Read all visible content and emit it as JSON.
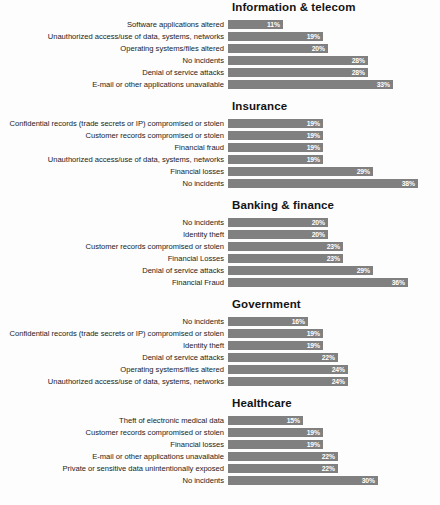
{
  "chart_data": {
    "type": "bar",
    "title": "",
    "subtitle": "",
    "xlabel": "",
    "ylabel": "",
    "orientation": "horizontal",
    "grid": false,
    "legend": "none",
    "value_suffix": "%",
    "xlim": [
      0,
      40
    ],
    "axis_max": 40,
    "panels": [
      {
        "title": "Information & telecom",
        "categories": [
          "Software applications altered",
          "Unauthorized access/use of data, systems, networks",
          "Operating systems/files altered",
          "No incidents",
          "Denial of service attacks",
          "E-mail or other applications unavailable"
        ],
        "values": [
          11,
          19,
          20,
          28,
          28,
          33
        ],
        "labels": [
          "11%",
          "19%",
          "20%",
          "28%",
          "28%",
          "33%"
        ]
      },
      {
        "title": "Insurance",
        "categories": [
          "Confidential records (trade secrets or IP) compromised or stolen",
          "Customer records compromised or stolen",
          "Financial fraud",
          "Unauthorized access/use of data, systems, networks",
          "Financial losses",
          "No incidents"
        ],
        "values": [
          19,
          19,
          19,
          19,
          29,
          38
        ],
        "labels": [
          "19%",
          "19%",
          "19%",
          "19%",
          "29%",
          "38%"
        ]
      },
      {
        "title": "Banking & finance",
        "categories": [
          "No incidents",
          "Identity theft",
          "Customer records compromised or stolen",
          "Financial Losses",
          "Denial of service attacks",
          "Financial Fraud"
        ],
        "values": [
          20,
          20,
          23,
          23,
          29,
          36
        ],
        "labels": [
          "20%",
          "20%",
          "23%",
          "23%",
          "29%",
          "36%"
        ]
      },
      {
        "title": "Government",
        "categories": [
          "No incidents",
          "Confidential records (trade secrets or IP) compromised or stolen",
          "Identity theft",
          "Denial of service attacks",
          "Operating systems/files altered",
          "Unauthorized access/use of data, systems, networks"
        ],
        "values": [
          16,
          19,
          19,
          22,
          24,
          24
        ],
        "labels": [
          "16%",
          "19%",
          "19%",
          "22%",
          "24%",
          "24%"
        ]
      },
      {
        "title": "Healthcare",
        "categories": [
          "Theft of electronic medical data",
          "Customer records compromised or stolen",
          "Financial losses",
          "E-mail or other applications unavailable",
          "Private or sensitive data unintentionally exposed",
          "No incidents"
        ],
        "values": [
          15,
          19,
          19,
          22,
          22,
          30
        ],
        "labels": [
          "15%",
          "19%",
          "19%",
          "22%",
          "22%",
          "30%"
        ]
      }
    ],
    "colors": {
      "bar": "#808080",
      "value_text": "#ffffff",
      "label_text": "#1c1c1c",
      "title_text": "#141414",
      "background": "#fdfdfd"
    }
  }
}
